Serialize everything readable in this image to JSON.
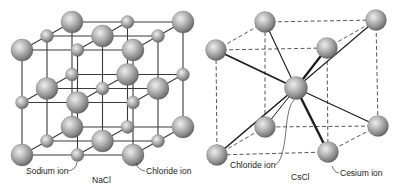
{
  "figure": {
    "panels": [
      {
        "id": "nacl",
        "caption": "NaCl",
        "structure": "face-centered cubic rock-salt lattice, 3x3x3 ion grid",
        "labels": [
          {
            "id": "sodium",
            "text": "Sodium ion"
          },
          {
            "id": "chloride",
            "text": "Chloride ion"
          }
        ],
        "ion_types": {
          "large": "Chloride ion",
          "small": "Sodium ion"
        }
      },
      {
        "id": "cscl",
        "caption": "CsCl",
        "structure": "body-centered cubic lattice, 8 corner ions + 1 center ion",
        "labels": [
          {
            "id": "chloride",
            "text": "Chloride ion"
          },
          {
            "id": "cesium",
            "text": "Cesium ion"
          }
        ],
        "ion_types": {
          "center": "Chloride ion",
          "corner": "Cesium ion"
        }
      }
    ],
    "colors": {
      "background": "#ffffff",
      "sphere_light": "#e6e6e6",
      "sphere_mid": "#a8a8a8",
      "sphere_dark": "#5a5a5a",
      "line": "#333333",
      "text": "#222222"
    }
  }
}
